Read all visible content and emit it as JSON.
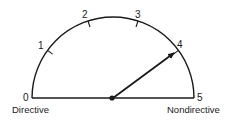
{
  "diagram": {
    "type": "semicircular-gauge",
    "scale": {
      "min": 0,
      "max": 5,
      "ticks": [
        "0",
        "1",
        "2",
        "3",
        "4",
        "5"
      ]
    },
    "labels": {
      "left": "Directive",
      "right": "Nondirective"
    },
    "pointer": {
      "value": 4,
      "style": "arrow"
    },
    "colors": {
      "stroke": "#1a1a1a",
      "background": "#ffffff"
    }
  }
}
